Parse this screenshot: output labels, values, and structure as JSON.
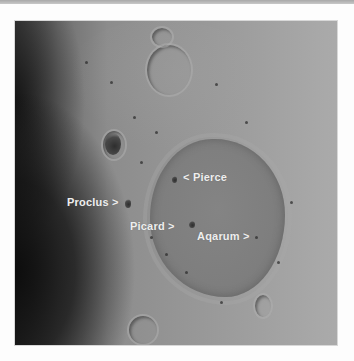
{
  "image": {
    "subject": "Moon surface near the terminator showing a large mare basin",
    "labels": [
      {
        "id": "pierce",
        "text": "< Pierce"
      },
      {
        "id": "proclus",
        "text": "Proclus >"
      },
      {
        "id": "picard",
        "text": "Picard >"
      },
      {
        "id": "aqarum",
        "text": "Aqarum >"
      }
    ],
    "colors": {
      "background": "#fdfdfd",
      "space": "#151515",
      "mare": "#808080",
      "highlands": "#9e9e9e",
      "label_text": "#eeeeee"
    }
  }
}
